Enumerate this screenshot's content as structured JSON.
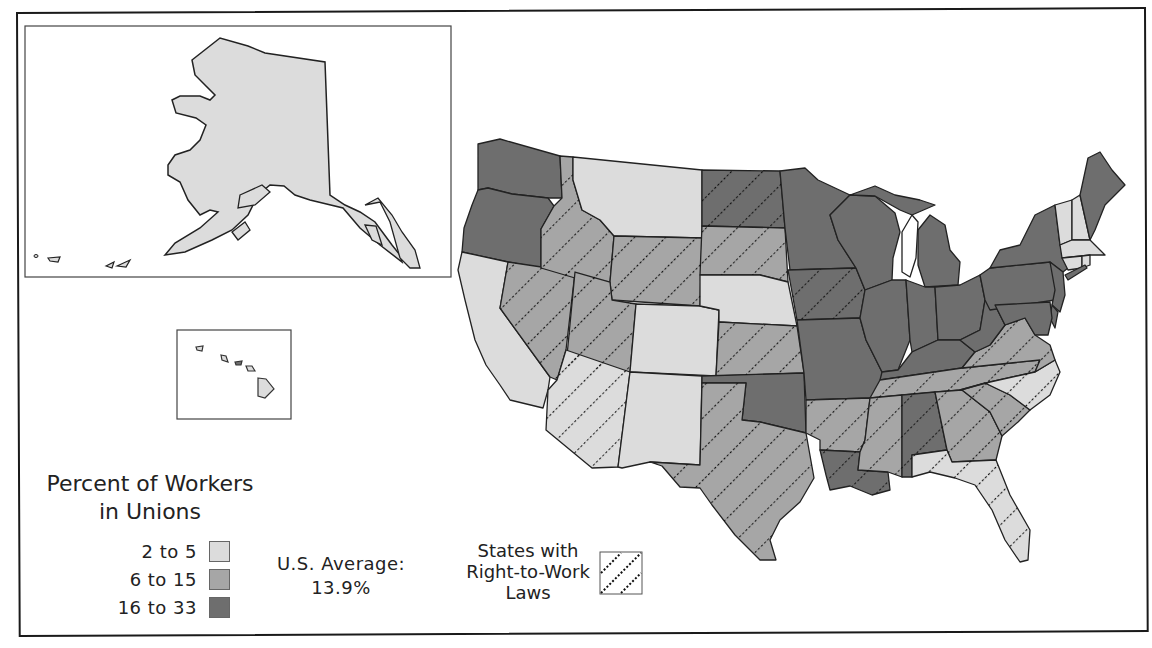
{
  "map": {
    "title": "Percent of Workers in Unions",
    "colors": {
      "low": "#dcdcdc",
      "mid": "#a6a6a6",
      "high": "#6e6e6e",
      "outline": "#222222",
      "hatch": "#111111"
    }
  },
  "legend": {
    "title_line1": "Percent of Workers",
    "title_line2": "in Unions",
    "items": [
      {
        "label": "2 to 5",
        "level": "low",
        "color": "#dcdcdc"
      },
      {
        "label": "6 to 15",
        "level": "mid",
        "color": "#a6a6a6"
      },
      {
        "label": "16 to 33",
        "level": "high",
        "color": "#6e6e6e"
      }
    ],
    "average_line1": "U.S. Average:",
    "average_line2": "13.9%",
    "rtw_line1": "States with",
    "rtw_line2": "Right-to-Work",
    "rtw_line3": "Laws"
  },
  "states": [
    {
      "name": "Washington",
      "level": "high",
      "rtw": false
    },
    {
      "name": "Oregon",
      "level": "high",
      "rtw": false
    },
    {
      "name": "California",
      "level": "low",
      "rtw": false
    },
    {
      "name": "Nevada",
      "level": "mid",
      "rtw": true
    },
    {
      "name": "Idaho",
      "level": "mid",
      "rtw": true
    },
    {
      "name": "Montana",
      "level": "low",
      "rtw": false
    },
    {
      "name": "Wyoming",
      "level": "mid",
      "rtw": true
    },
    {
      "name": "Utah",
      "level": "mid",
      "rtw": true
    },
    {
      "name": "Arizona",
      "level": "low",
      "rtw": true
    },
    {
      "name": "Colorado",
      "level": "low",
      "rtw": false
    },
    {
      "name": "New Mexico",
      "level": "low",
      "rtw": false
    },
    {
      "name": "North Dakota",
      "level": "high",
      "rtw": true
    },
    {
      "name": "South Dakota",
      "level": "mid",
      "rtw": true
    },
    {
      "name": "Nebraska",
      "level": "low",
      "rtw": false
    },
    {
      "name": "Kansas",
      "level": "mid",
      "rtw": true
    },
    {
      "name": "Oklahoma",
      "level": "high",
      "rtw": false
    },
    {
      "name": "Texas",
      "level": "mid",
      "rtw": true
    },
    {
      "name": "Minnesota",
      "level": "high",
      "rtw": false
    },
    {
      "name": "Iowa",
      "level": "high",
      "rtw": true
    },
    {
      "name": "Missouri",
      "level": "high",
      "rtw": false
    },
    {
      "name": "Arkansas",
      "level": "mid",
      "rtw": true
    },
    {
      "name": "Louisiana",
      "level": "high",
      "rtw": true
    },
    {
      "name": "Wisconsin",
      "level": "high",
      "rtw": false
    },
    {
      "name": "Illinois",
      "level": "high",
      "rtw": false
    },
    {
      "name": "Michigan",
      "level": "high",
      "rtw": false
    },
    {
      "name": "Indiana",
      "level": "high",
      "rtw": false
    },
    {
      "name": "Ohio",
      "level": "high",
      "rtw": false
    },
    {
      "name": "Kentucky",
      "level": "high",
      "rtw": false
    },
    {
      "name": "Tennessee",
      "level": "mid",
      "rtw": true
    },
    {
      "name": "Mississippi",
      "level": "mid",
      "rtw": true
    },
    {
      "name": "Alabama",
      "level": "high",
      "rtw": true
    },
    {
      "name": "Georgia",
      "level": "mid",
      "rtw": true
    },
    {
      "name": "Florida",
      "level": "low",
      "rtw": true
    },
    {
      "name": "South Carolina",
      "level": "mid",
      "rtw": true
    },
    {
      "name": "North Carolina",
      "level": "low",
      "rtw": true
    },
    {
      "name": "Virginia",
      "level": "mid",
      "rtw": true
    },
    {
      "name": "West Virginia",
      "level": "high",
      "rtw": false
    },
    {
      "name": "Pennsylvania",
      "level": "high",
      "rtw": false
    },
    {
      "name": "New York",
      "level": "high",
      "rtw": false
    },
    {
      "name": "New Jersey",
      "level": "high",
      "rtw": false
    },
    {
      "name": "Delaware",
      "level": "high",
      "rtw": false
    },
    {
      "name": "Maryland",
      "level": "high",
      "rtw": false
    },
    {
      "name": "Vermont",
      "level": "low",
      "rtw": false
    },
    {
      "name": "New Hampshire",
      "level": "low",
      "rtw": false
    },
    {
      "name": "Maine",
      "level": "high",
      "rtw": false
    },
    {
      "name": "Massachusetts",
      "level": "low",
      "rtw": false
    },
    {
      "name": "Connecticut",
      "level": "low",
      "rtw": false
    },
    {
      "name": "Rhode Island",
      "level": "low",
      "rtw": false
    },
    {
      "name": "Alaska",
      "level": "low",
      "rtw": false
    },
    {
      "name": "Hawaii",
      "level": "low",
      "rtw": false
    }
  ]
}
